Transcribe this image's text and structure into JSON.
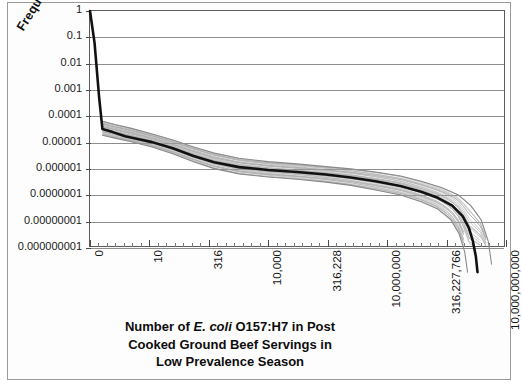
{
  "chart_data": {
    "type": "line",
    "title": "",
    "subtitle": "",
    "xlabel_parts": {
      "line1_pre": "Number of ",
      "line1_italic": "E. coli",
      "line1_post": " O157:H7 in Post",
      "line2": "Cooked Ground Beef Servings in",
      "line3": "Low Prevalence Season"
    },
    "xlabel": "Number of E. coli O157:H7 in Post Cooked Ground Beef Servings in Low Prevalence Season",
    "ylabel": "Frequency",
    "grid": true,
    "legend": "none",
    "yscale": "log",
    "ylim": [
      1e-09,
      1
    ],
    "ytick_labels": [
      "1",
      "0.1",
      "0.01",
      "0.001",
      "0.0001",
      "0.00001",
      "0.000001",
      "0.0000001",
      "0.00000001",
      "0.000000001"
    ],
    "ytick_values": [
      1,
      0.1,
      0.01,
      0.001,
      0.0001,
      1e-05,
      1e-06,
      1e-07,
      1e-08,
      1e-09
    ],
    "xtick_labels": [
      "0",
      "10",
      "316",
      "10,000",
      "316,228",
      "10,000,000",
      "316,227,766",
      "10,000,000,000"
    ],
    "xtick_values": [
      0,
      10,
      316,
      10000,
      316228,
      10000000,
      316227766,
      10000000000
    ],
    "xtick_fractions": [
      0.0,
      0.143,
      0.286,
      0.429,
      0.571,
      0.714,
      0.857,
      1.0
    ],
    "minor_xtick_count_between_majors": 6,
    "series": [
      {
        "name": "mean exceedance curve",
        "color": "#111111",
        "width": 2.6,
        "points": [
          [
            0.0,
            1.0
          ],
          [
            0.011,
            0.06
          ],
          [
            0.022,
            0.0005
          ],
          [
            0.03,
            3e-05
          ],
          [
            0.055,
            2.3e-05
          ],
          [
            0.085,
            1.6e-05
          ],
          [
            0.115,
            1.25e-05
          ],
          [
            0.15,
            9.5e-06
          ],
          [
            0.2,
            5.5e-06
          ],
          [
            0.25,
            2.8e-06
          ],
          [
            0.3,
            1.6e-06
          ],
          [
            0.36,
            1.05e-06
          ],
          [
            0.43,
            8.2e-07
          ],
          [
            0.5,
            6.8e-07
          ],
          [
            0.57,
            5.5e-07
          ],
          [
            0.63,
            4.2e-07
          ],
          [
            0.69,
            3e-07
          ],
          [
            0.75,
            2e-07
          ],
          [
            0.8,
            1.2e-07
          ],
          [
            0.84,
            7e-08
          ],
          [
            0.875,
            3.5e-08
          ],
          [
            0.9,
            1.4e-08
          ],
          [
            0.915,
            5e-09
          ],
          [
            0.925,
            1.5e-09
          ],
          [
            0.932,
            4e-10
          ],
          [
            0.936,
            1e-10
          ]
        ]
      },
      {
        "name": "uncertainty band upper",
        "color": "#8a8a8a",
        "width": 1.1,
        "points": [
          [
            0.03,
            6e-05
          ],
          [
            0.06,
            4.5e-05
          ],
          [
            0.1,
            3.2e-05
          ],
          [
            0.15,
            1.95e-05
          ],
          [
            0.2,
            1.15e-05
          ],
          [
            0.25,
            6.2e-06
          ],
          [
            0.3,
            3.6e-06
          ],
          [
            0.36,
            2.3e-06
          ],
          [
            0.43,
            1.7e-06
          ],
          [
            0.5,
            1.4e-06
          ],
          [
            0.57,
            1.1e-06
          ],
          [
            0.63,
            9e-07
          ],
          [
            0.69,
            6.8e-07
          ],
          [
            0.75,
            4.8e-07
          ],
          [
            0.8,
            3e-07
          ],
          [
            0.85,
            1.7e-07
          ],
          [
            0.89,
            9e-08
          ],
          [
            0.92,
            3.5e-08
          ],
          [
            0.945,
            1e-08
          ],
          [
            0.962,
            1.5e-09
          ],
          [
            0.97,
            2e-10
          ]
        ]
      },
      {
        "name": "uncertainty band lower",
        "color": "#8a8a8a",
        "width": 1.1,
        "points": [
          [
            0.03,
            1.75e-05
          ],
          [
            0.06,
            1.35e-05
          ],
          [
            0.1,
            9.8e-06
          ],
          [
            0.15,
            6.2e-06
          ],
          [
            0.2,
            3.4e-06
          ],
          [
            0.25,
            1.7e-06
          ],
          [
            0.3,
            9.2e-07
          ],
          [
            0.36,
            5.8e-07
          ],
          [
            0.43,
            4.4e-07
          ],
          [
            0.5,
            3.6e-07
          ],
          [
            0.57,
            2.8e-07
          ],
          [
            0.63,
            2.1e-07
          ],
          [
            0.69,
            1.4e-07
          ],
          [
            0.75,
            9e-08
          ],
          [
            0.8,
            5e-08
          ],
          [
            0.84,
            2.6e-08
          ],
          [
            0.872,
            1e-08
          ],
          [
            0.892,
            2.8e-09
          ],
          [
            0.905,
            6e-10
          ],
          [
            0.912,
            1e-10
          ]
        ]
      }
    ],
    "band_fill_color": "#9e9e9e",
    "band_line_count": 26
  }
}
